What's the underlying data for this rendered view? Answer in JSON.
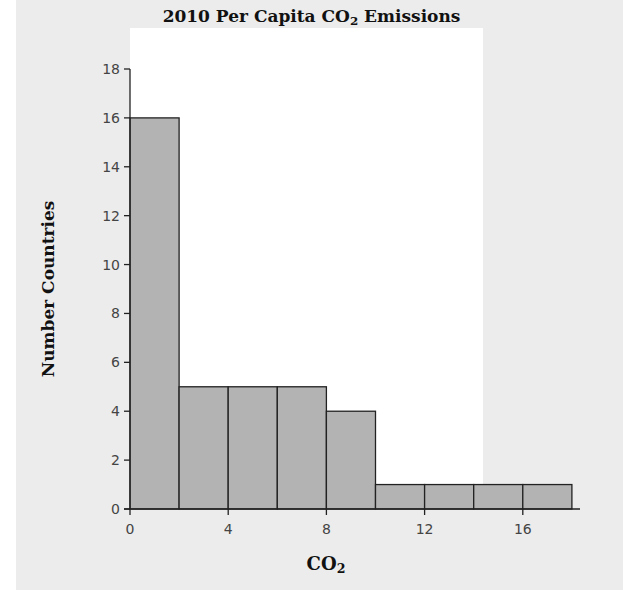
{
  "chart_data": {
    "type": "bar",
    "subtype": "histogram",
    "title": "2010 Per Capita CO2 Emissions",
    "title_parts": {
      "before": "2010 Per Capita CO",
      "sub": "2",
      "after": " Emissions"
    },
    "xlabel": "CO2",
    "xlabel_parts": {
      "before": "CO",
      "sub": "2"
    },
    "ylabel": "Number Countries",
    "bin_width": 2,
    "bins": [
      [
        0,
        2
      ],
      [
        2,
        4
      ],
      [
        4,
        6
      ],
      [
        6,
        8
      ],
      [
        8,
        10
      ],
      [
        10,
        12
      ],
      [
        12,
        14
      ],
      [
        14,
        16
      ],
      [
        16,
        18
      ]
    ],
    "categories": [
      "0-2",
      "2-4",
      "4-6",
      "6-8",
      "8-10",
      "10-12",
      "12-14",
      "14-16",
      "16-18"
    ],
    "values": [
      16,
      5,
      5,
      5,
      4,
      1,
      1,
      1,
      1
    ],
    "xlim": [
      -1,
      19
    ],
    "ylim": [
      0,
      18
    ],
    "x_ticks": [
      0,
      4,
      8,
      12,
      16
    ],
    "y_ticks": [
      0,
      2,
      4,
      6,
      8,
      10,
      12,
      14,
      16,
      18
    ],
    "grid": false,
    "legend": null,
    "colors": {
      "bar_fill": "#b3b3b3",
      "bar_edge": "#222222",
      "panel_bg": "#ececec",
      "plot_bg": "#ffffff"
    }
  }
}
